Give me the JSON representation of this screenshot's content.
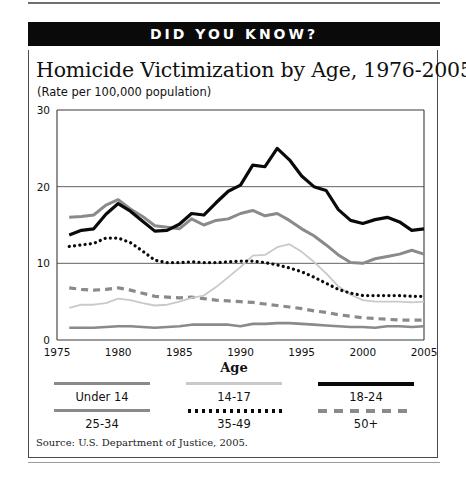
{
  "banner": {
    "text": "DID YOU KNOW?"
  },
  "source": {
    "text": "Source: U.S. Department of Justice, 2005."
  },
  "legend": {
    "title": "Age",
    "items": [
      {
        "label": "Under 14",
        "style": "solid-gray",
        "color": "#8a8a8a"
      },
      {
        "label": "14-17",
        "style": "thin-light",
        "color": "#c9c9c9"
      },
      {
        "label": "18-24",
        "style": "solid-black",
        "color": "#0a0a0a"
      },
      {
        "label": "25-34",
        "style": "solid-gray2",
        "color": "#8a8a8a"
      },
      {
        "label": "35-49",
        "style": "dotted",
        "color": "#0a0a0a"
      },
      {
        "label": "50+",
        "style": "dashed",
        "color": "#8a8a8a"
      }
    ]
  },
  "chart_data": {
    "type": "line",
    "title": "Homicide Victimization by Age, 1976-2005",
    "subtitle": "(Rate per 100,000 population)",
    "xlabel": "",
    "ylabel": "",
    "legend_title": "Age",
    "legend_position": "bottom",
    "grid": true,
    "xlim": [
      1975,
      2005
    ],
    "ylim": [
      0,
      30
    ],
    "yticks": [
      0,
      10,
      20,
      30
    ],
    "ytick_labels": [
      "0",
      "10",
      "20",
      "30"
    ],
    "xticks": [
      1975,
      1980,
      1985,
      1990,
      1995,
      2000,
      2005
    ],
    "xtick_labels": [
      "1975",
      "1980",
      "1985",
      "1990",
      "1995",
      "2000",
      "2005"
    ],
    "x": [
      1976,
      1977,
      1978,
      1979,
      1980,
      1981,
      1982,
      1983,
      1984,
      1985,
      1986,
      1987,
      1988,
      1989,
      1990,
      1991,
      1992,
      1993,
      1994,
      1995,
      1996,
      1997,
      1998,
      1999,
      2000,
      2001,
      2002,
      2003,
      2004,
      2005
    ],
    "series": [
      {
        "name": "Under 14",
        "style": "solid-gray",
        "color": "#8a8a8a",
        "values": [
          1.6,
          1.6,
          1.6,
          1.7,
          1.8,
          1.8,
          1.7,
          1.6,
          1.7,
          1.8,
          2.0,
          2.0,
          2.0,
          2.0,
          1.8,
          2.1,
          2.1,
          2.2,
          2.2,
          2.1,
          2.0,
          1.9,
          1.8,
          1.7,
          1.7,
          1.6,
          1.8,
          1.8,
          1.7,
          1.8
        ]
      },
      {
        "name": "14-17",
        "style": "thin-light",
        "color": "#c9c9c9",
        "values": [
          4.2,
          4.6,
          4.6,
          4.8,
          5.4,
          5.2,
          4.8,
          4.5,
          4.6,
          5.0,
          5.5,
          5.8,
          6.9,
          8.2,
          9.5,
          11.0,
          11.1,
          12.1,
          12.5,
          11.5,
          10.2,
          8.7,
          7.0,
          5.9,
          5.2,
          5.0,
          5.0,
          5.0,
          4.9,
          5.0
        ]
      },
      {
        "name": "18-24",
        "style": "solid-black",
        "color": "#0a0a0a",
        "values": [
          13.7,
          14.3,
          14.5,
          16.4,
          17.8,
          16.8,
          15.5,
          14.2,
          14.3,
          15.1,
          16.5,
          16.3,
          17.9,
          19.4,
          20.2,
          22.8,
          22.6,
          25.0,
          23.5,
          21.4,
          20.0,
          19.5,
          17.0,
          15.6,
          15.2,
          15.7,
          16.0,
          15.4,
          14.3,
          14.5
        ]
      },
      {
        "name": "25-34",
        "style": "solid-gray2",
        "color": "#8a8a8a",
        "values": [
          16.0,
          16.1,
          16.3,
          17.6,
          18.3,
          17.1,
          16.1,
          14.9,
          14.7,
          14.5,
          15.8,
          15.0,
          15.6,
          15.8,
          16.5,
          16.9,
          16.2,
          16.5,
          15.6,
          14.5,
          13.6,
          12.4,
          11.1,
          10.1,
          10.0,
          10.6,
          10.9,
          11.2,
          11.7,
          11.2
        ]
      },
      {
        "name": "35-49",
        "style": "dotted",
        "color": "#0a0a0a",
        "values": [
          12.2,
          12.4,
          12.6,
          13.3,
          13.3,
          12.7,
          11.6,
          10.4,
          10.1,
          10.1,
          10.2,
          10.1,
          10.1,
          10.2,
          10.3,
          10.3,
          10.1,
          9.8,
          9.4,
          8.9,
          8.2,
          7.4,
          6.6,
          6.1,
          5.8,
          5.8,
          5.8,
          5.8,
          5.7,
          5.7
        ]
      },
      {
        "name": "50+",
        "style": "dashed",
        "color": "#8a8a8a",
        "values": [
          6.8,
          6.6,
          6.5,
          6.6,
          6.8,
          6.5,
          6.1,
          5.7,
          5.6,
          5.5,
          5.6,
          5.4,
          5.2,
          5.1,
          5.0,
          4.9,
          4.7,
          4.5,
          4.3,
          4.1,
          3.8,
          3.6,
          3.3,
          3.1,
          2.9,
          2.8,
          2.7,
          2.6,
          2.6,
          2.6
        ]
      }
    ]
  }
}
